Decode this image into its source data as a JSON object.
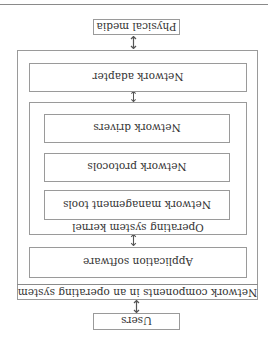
{
  "diagram": {
    "title": "Network components in an operating system",
    "nodes": {
      "users": "Users",
      "outer_label": "Network components in an operating system",
      "application_software": "Application software",
      "kernel_label": "Operating system kernel",
      "network_management_tools": "Network management tools",
      "network_protocols": "Network protocols",
      "network_drivers": "Network drivers",
      "network_adapter": "Network adapter",
      "physical_media": "Physical media"
    },
    "edges": [
      {
        "from": "users",
        "to": "network_components",
        "style": "double-arrow"
      },
      {
        "from": "application_software",
        "to": "kernel",
        "style": "double-arrow"
      },
      {
        "from": "kernel",
        "to": "network_adapter",
        "style": "double-arrow"
      },
      {
        "from": "network_adapter",
        "to": "physical_media",
        "style": "double-arrow"
      }
    ],
    "orientation": "rotated 180 degrees"
  }
}
